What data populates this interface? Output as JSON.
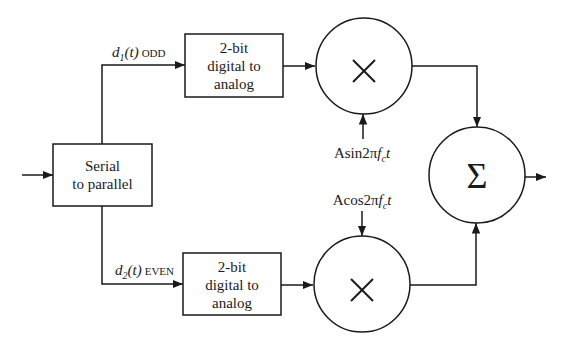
{
  "diagram": {
    "type": "QPSK/QAM modulator block diagram",
    "blocks": {
      "serial_to_parallel": {
        "line1": "Serial",
        "line2": "to parallel"
      },
      "dac_top": {
        "line1": "2-bit",
        "line2": "digital to",
        "line3": "analog"
      },
      "dac_bottom": {
        "line1": "2-bit",
        "line2": "digital to",
        "line3": "analog"
      },
      "multiplier_top": {
        "symbol": "×"
      },
      "multiplier_bottom": {
        "symbol": "×"
      },
      "summer": {
        "symbol": "Σ"
      }
    },
    "signals": {
      "odd": {
        "base": "d",
        "sub": "1",
        "arg": "(t)",
        "tag": "ODD"
      },
      "even": {
        "base": "d",
        "sub": "2",
        "arg": "(t)",
        "tag": "EVEN"
      },
      "sin_carrier": {
        "prefix": "Asin2π",
        "f": "f",
        "sub": "c",
        "t": "t"
      },
      "cos_carrier": {
        "prefix": "Acos2π",
        "f": "f",
        "sub": "c",
        "t": "t"
      }
    },
    "colors": {
      "stroke": "#1a1a1a",
      "background": "#ffffff"
    }
  }
}
